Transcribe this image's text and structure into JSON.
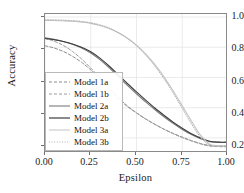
{
  "chart_data": {
    "type": "line",
    "title": "",
    "xlabel": "Epsilon",
    "ylabel": "Accuracy",
    "xlim": [
      0.0,
      1.0
    ],
    "ylim": [
      0.1,
      1.02
    ],
    "xticks": [
      "0.00",
      "0.25",
      "0.50",
      "0.75",
      "1.00"
    ],
    "xtick_values": [
      0.0,
      0.25,
      0.5,
      0.75,
      1.0
    ],
    "yticks": [
      "0.2",
      "0.4",
      "0.6",
      "0.8",
      "1.0"
    ],
    "ytick_values": [
      0.2,
      0.4,
      0.6,
      0.8,
      1.0
    ],
    "grid": true,
    "legend_position": "center left",
    "series": [
      {
        "name": "Model 1a",
        "style": "dashed",
        "color": "#8c8c8c",
        "x": [
          0.0,
          0.05,
          0.1,
          0.15,
          0.2,
          0.25,
          0.3,
          0.35,
          0.4,
          0.45,
          0.5,
          0.55,
          0.6,
          0.65,
          0.7,
          0.75,
          0.8,
          0.85,
          0.9,
          0.95,
          1.0
        ],
        "y": [
          0.81,
          0.795,
          0.772,
          0.74,
          0.7,
          0.65,
          0.59,
          0.525,
          0.462,
          0.408,
          0.365,
          0.325,
          0.29,
          0.258,
          0.23,
          0.205,
          0.182,
          0.163,
          0.15,
          0.147,
          0.147
        ]
      },
      {
        "name": "Model 1b",
        "style": "dashed",
        "color": "#9a9a9a",
        "x": [
          0.0,
          0.05,
          0.1,
          0.15,
          0.2,
          0.25,
          0.3,
          0.35,
          0.4,
          0.45,
          0.5,
          0.55,
          0.6,
          0.65,
          0.7,
          0.75,
          0.8,
          0.85,
          0.9,
          0.95,
          1.0
        ],
        "y": [
          0.858,
          0.84,
          0.812,
          0.772,
          0.722,
          0.662,
          0.598,
          0.53,
          0.468,
          0.412,
          0.366,
          0.326,
          0.29,
          0.257,
          0.228,
          0.202,
          0.18,
          0.16,
          0.146,
          0.142,
          0.141
        ]
      },
      {
        "name": "Model 2a",
        "style": "solid",
        "color": "#7a7a7a",
        "x": [
          0.0,
          0.05,
          0.1,
          0.15,
          0.2,
          0.25,
          0.3,
          0.35,
          0.4,
          0.45,
          0.5,
          0.55,
          0.6,
          0.65,
          0.7,
          0.75,
          0.8,
          0.85,
          0.9,
          0.95,
          1.0
        ],
        "y": [
          0.862,
          0.852,
          0.838,
          0.82,
          0.795,
          0.762,
          0.718,
          0.665,
          0.606,
          0.548,
          0.492,
          0.438,
          0.388,
          0.34,
          0.296,
          0.256,
          0.222,
          0.194,
          0.175,
          0.17,
          0.17
        ]
      },
      {
        "name": "Model 2b",
        "style": "solid",
        "color": "#3c3c3c",
        "x": [
          0.0,
          0.05,
          0.1,
          0.15,
          0.2,
          0.25,
          0.3,
          0.35,
          0.4,
          0.45,
          0.5,
          0.55,
          0.6,
          0.65,
          0.7,
          0.75,
          0.8,
          0.85,
          0.9,
          0.95,
          1.0
        ],
        "y": [
          0.858,
          0.85,
          0.838,
          0.822,
          0.8,
          0.77,
          0.728,
          0.676,
          0.618,
          0.56,
          0.504,
          0.45,
          0.398,
          0.35,
          0.304,
          0.264,
          0.228,
          0.2,
          0.178,
          0.172,
          0.172
        ]
      },
      {
        "name": "Model 3a",
        "style": "solid",
        "color": "#c4c4c4",
        "x": [
          0.0,
          0.05,
          0.1,
          0.15,
          0.2,
          0.25,
          0.3,
          0.35,
          0.4,
          0.45,
          0.5,
          0.55,
          0.6,
          0.65,
          0.7,
          0.75,
          0.8,
          0.85,
          0.9,
          0.95,
          1.0
        ],
        "y": [
          0.978,
          0.977,
          0.975,
          0.972,
          0.966,
          0.958,
          0.944,
          0.924,
          0.896,
          0.86,
          0.814,
          0.756,
          0.686,
          0.604,
          0.512,
          0.412,
          0.312,
          0.218,
          0.158,
          0.148,
          0.148
        ]
      },
      {
        "name": "Model 3b",
        "style": "dotted",
        "color": "#b0b0b0",
        "x": [
          0.0,
          0.05,
          0.1,
          0.15,
          0.2,
          0.25,
          0.3,
          0.35,
          0.4,
          0.45,
          0.5,
          0.55,
          0.6,
          0.65,
          0.7,
          0.75,
          0.8,
          0.85,
          0.9,
          0.95,
          1.0
        ],
        "y": [
          0.982,
          0.981,
          0.979,
          0.976,
          0.971,
          0.962,
          0.948,
          0.928,
          0.898,
          0.86,
          0.81,
          0.748,
          0.676,
          0.592,
          0.498,
          0.396,
          0.294,
          0.204,
          0.152,
          0.144,
          0.144
        ]
      }
    ]
  },
  "axes": {
    "xlabel": "Epsilon",
    "ylabel": "Accuracy",
    "xticks": [
      "0.00",
      "0.25",
      "0.50",
      "0.75",
      "1.00"
    ],
    "yticks": [
      "1.0",
      "0.8",
      "0.6",
      "0.4",
      "0.2"
    ]
  },
  "legend": {
    "entries": [
      {
        "label": "Model 1a"
      },
      {
        "label": "Model 1b"
      },
      {
        "label": "Model 2a"
      },
      {
        "label": "Model 2b"
      },
      {
        "label": "Model 3a"
      },
      {
        "label": "Model 3b"
      }
    ]
  }
}
